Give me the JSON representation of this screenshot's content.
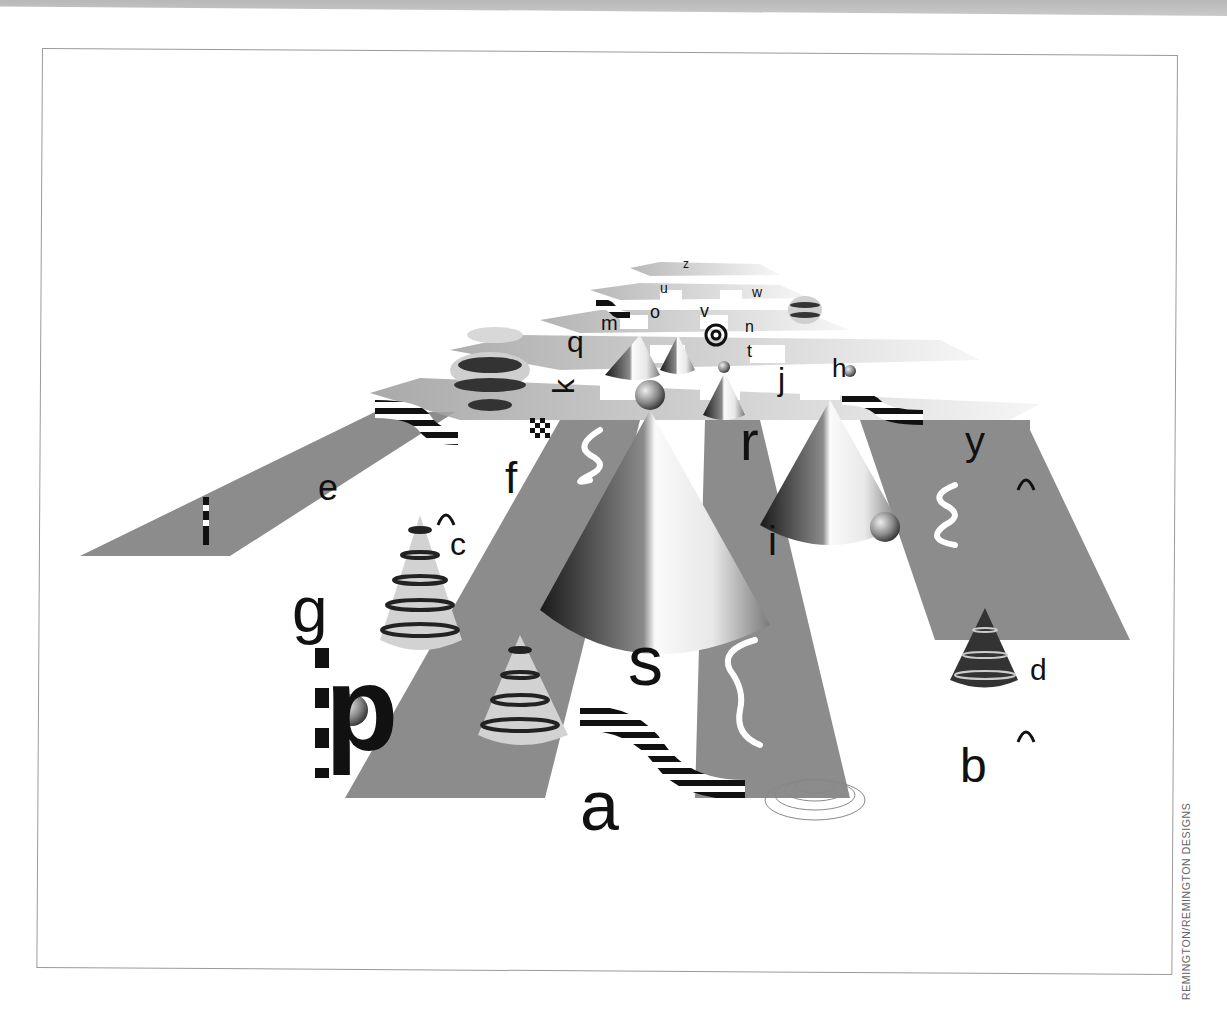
{
  "page": {
    "credit": "REMINGTON/REMINGTON DESIGNS"
  },
  "artwork": {
    "description": "Alphabet letters placed on a perspective checkerboard plane with cones, spheres, wave stripes and shadows",
    "letters": {
      "a": "a",
      "b": "b",
      "c": "c",
      "d": "d",
      "e": "e",
      "f": "f",
      "g": "g",
      "h": "h",
      "i": "i",
      "j": "j",
      "k": "k",
      "m": "m",
      "n": "n",
      "o": "o",
      "p": "p",
      "q": "q",
      "r": "r",
      "s": "s",
      "t": "t",
      "u": "u",
      "v": "v",
      "w": "w",
      "y": "y",
      "z": "z"
    },
    "colors": {
      "strip_gray": "#8c8c8c",
      "tile_light": "#e6e6e6",
      "ink": "#111111",
      "shadow": "#c8c8c8"
    }
  }
}
